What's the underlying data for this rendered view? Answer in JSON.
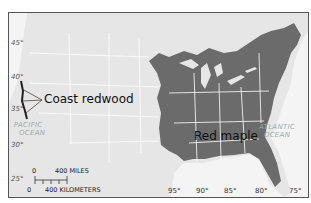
{
  "map": {
    "labels": {
      "coast_redwood": "Coast redwood",
      "red_maple": "Red maple"
    },
    "oceans": {
      "pacific_line1": "PACIFIC",
      "pacific_line2": "OCEAN",
      "atlantic_line1": "ATLANTIC",
      "atlantic_line2": "OCEAN"
    },
    "latitudes": [
      "45°",
      "40°",
      "35°",
      "30°",
      "25°"
    ],
    "longitudes": [
      "95°",
      "90°",
      "85°",
      "80°",
      "75°"
    ],
    "scale_bar": {
      "zero_top": "0",
      "miles": "400 MILES",
      "zero_bottom": "0",
      "kilometers": "400 KILOMETERS"
    },
    "colors": {
      "land": "#e6e6e6",
      "red_maple_range": "#6b6b6b",
      "coast_redwood_range": "#333333",
      "ocean": "#f4f4f4",
      "borders": "#ffffff"
    }
  }
}
